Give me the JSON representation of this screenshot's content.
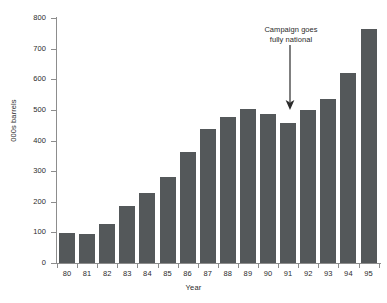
{
  "chart_data": {
    "type": "bar",
    "title": "",
    "subtitle": "",
    "xlabel": "Year",
    "ylabel": "000s barrels",
    "categories": [
      "80",
      "81",
      "82",
      "83",
      "84",
      "85",
      "86",
      "87",
      "88",
      "89",
      "90",
      "91",
      "92",
      "93",
      "94",
      "95"
    ],
    "values": [
      98,
      95,
      128,
      185,
      230,
      280,
      363,
      437,
      478,
      502,
      487,
      457,
      500,
      535,
      622,
      765
    ],
    "ylim": [
      0,
      800
    ],
    "yticks": [
      0,
      100,
      200,
      300,
      400,
      500,
      600,
      700,
      800
    ],
    "ytick_labels": [
      "0",
      "100",
      "200",
      "300",
      "400",
      "500",
      "600",
      "700",
      "800"
    ],
    "grid": false,
    "legend": "none",
    "bar_color": "#54585a",
    "axis_color": "#8d8d8d",
    "text_color": "#2b2b2b",
    "background": "#ffffff",
    "annotations": [
      {
        "text_line_1": "Campaign goes",
        "text_line_2": "fully national",
        "points_to_category": "91",
        "arrow": "down-arrow-icon"
      }
    ]
  }
}
